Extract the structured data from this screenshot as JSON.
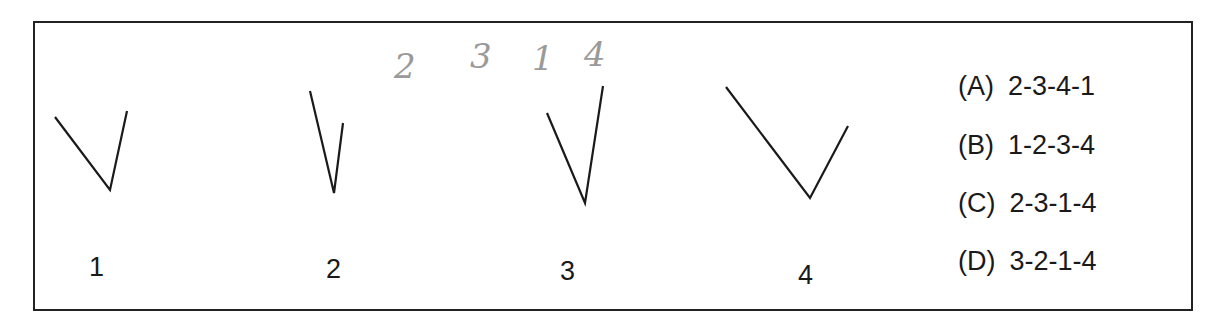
{
  "figures": [
    {
      "label": "1",
      "points": "55,117 110,190 127,111"
    },
    {
      "label": "2",
      "points": "310,91 334,193 343,123"
    },
    {
      "label": "3",
      "points": "547,113 585,203 603,86"
    },
    {
      "label": "4",
      "points": "726,87 810,198 848,126"
    }
  ],
  "handwritten": [
    "2",
    "3",
    "1",
    "4"
  ],
  "options": [
    {
      "letter": "(A)",
      "value": "2-3-4-1"
    },
    {
      "letter": "(B)",
      "value": "1-2-3-4"
    },
    {
      "letter": "(C)",
      "value": "2-3-1-4"
    },
    {
      "letter": "(D)",
      "value": "3-2-1-4"
    }
  ]
}
